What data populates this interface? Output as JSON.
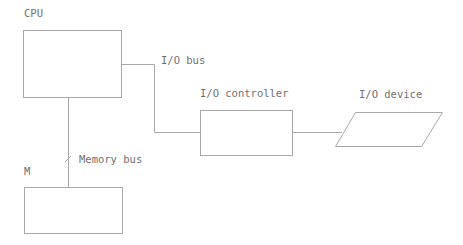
{
  "diagram": {
    "nodes": [
      {
        "id": "cpu",
        "label": "CPU",
        "shape": "rectangle"
      },
      {
        "id": "memory",
        "label": "M",
        "shape": "rectangle"
      },
      {
        "id": "io_controller",
        "label": "I/O controller",
        "shape": "rectangle"
      },
      {
        "id": "io_device",
        "label": "I/O device",
        "shape": "parallelogram"
      }
    ],
    "edges": [
      {
        "from": "cpu",
        "to": "io_controller",
        "label": "I/O bus"
      },
      {
        "from": "cpu",
        "to": "memory",
        "label": "Memory bus",
        "marker": "slash"
      },
      {
        "from": "io_controller",
        "to": "io_device",
        "label": ""
      }
    ]
  },
  "labels": {
    "cpu": "CPU",
    "memory": "M",
    "io_controller": "I/O controller",
    "io_device": "I/O device",
    "io_bus": "I/O bus",
    "memory_bus": "Memory bus"
  },
  "colors": {
    "stroke": "#a8a8a8",
    "text": "#707070",
    "background": "#ffffff"
  }
}
